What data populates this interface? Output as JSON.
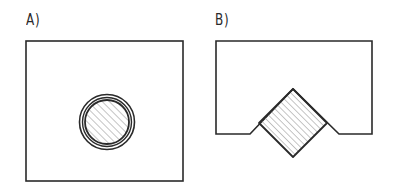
{
  "figures": [
    {
      "label": "A)",
      "description": "Rectangle with a concentric double-ring circle containing a hatched disc at its center"
    },
    {
      "label": "B)",
      "description": "Block with a V-notch on its bottom edge holding a hatched square rotated 45 degrees"
    }
  ],
  "colors": {
    "stroke": "#2a2a2a",
    "hatch": "#8a8a8a",
    "background": "#ffffff"
  }
}
